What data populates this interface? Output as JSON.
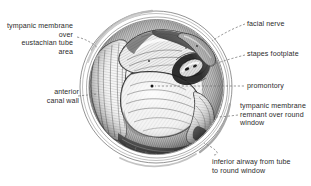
{
  "figure": {
    "kind": "medical-illustration",
    "view_shape": "circle",
    "style": "pen-and-ink stipple hatching, grayscale",
    "colors": {
      "background": "#ffffff",
      "ink": "#1a1a1a",
      "label_text": "#2b2b2b",
      "leader_line": "#6e6e6e",
      "mid_tone": "#9a9a9a",
      "light_tone": "#d8d8d8"
    }
  },
  "labels": {
    "tympanic_membrane_eustachian": "tympanic membrane\nover\neustachian tube\narea",
    "anterior_canal_wall": "anterior\ncanal wall",
    "facial_nerve": "facial nerve",
    "stapes_footplate": "stapes footplate",
    "promontory": "promontory",
    "tympanic_membrane_remnant": "tympanic membrane\nremnant over round\nwindow",
    "inferior_airway": "inferior airway from tube\nto round window"
  }
}
